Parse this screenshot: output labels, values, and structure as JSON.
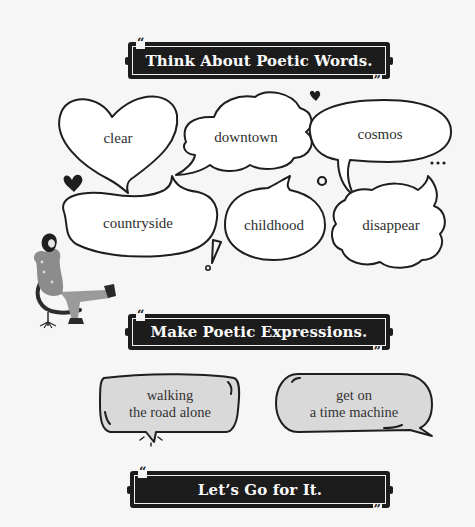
{
  "sections": [
    {
      "title": "Think About Poetic Words.",
      "open_quote": "“",
      "close_quote": "”"
    },
    {
      "title": "Make Poetic Expressions.",
      "open_quote": "“",
      "close_quote": "”"
    },
    {
      "title": "Let’s Go for It.",
      "open_quote": "“",
      "close_quote": "”"
    }
  ],
  "words": [
    {
      "text": "clear",
      "shape": "heart"
    },
    {
      "text": "downtown",
      "shape": "cloud"
    },
    {
      "text": "cosmos",
      "shape": "oval"
    },
    {
      "text": "countryside",
      "shape": "bean"
    },
    {
      "text": "childhood",
      "shape": "oval"
    },
    {
      "text": "disappear",
      "shape": "cloud"
    }
  ],
  "expressions": [
    {
      "line1": "walking",
      "line2": "the road alone"
    },
    {
      "line1": "get on",
      "line2": "a time machine"
    }
  ],
  "decorations": {
    "ellipsis": "...",
    "exclamation": "!",
    "illustration": "person-relaxing-in-chair"
  },
  "colors": {
    "background": "#f6f6f6",
    "banner": "#1c1c1c",
    "bubble_stroke": "#1e1e1e",
    "expression_fill": "#d9d9d9"
  }
}
